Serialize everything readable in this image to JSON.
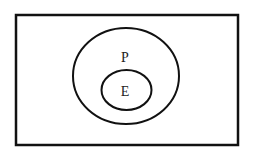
{
  "diagram": {
    "type": "euler-diagram",
    "universe": {
      "label": ""
    },
    "sets": [
      {
        "id": "P",
        "label": "P",
        "contains": [
          "E"
        ]
      },
      {
        "id": "E",
        "label": "E",
        "subset_of": "P"
      }
    ],
    "colors": {
      "stroke": "#111111",
      "background": "#ffffff",
      "text": "#222222"
    }
  }
}
